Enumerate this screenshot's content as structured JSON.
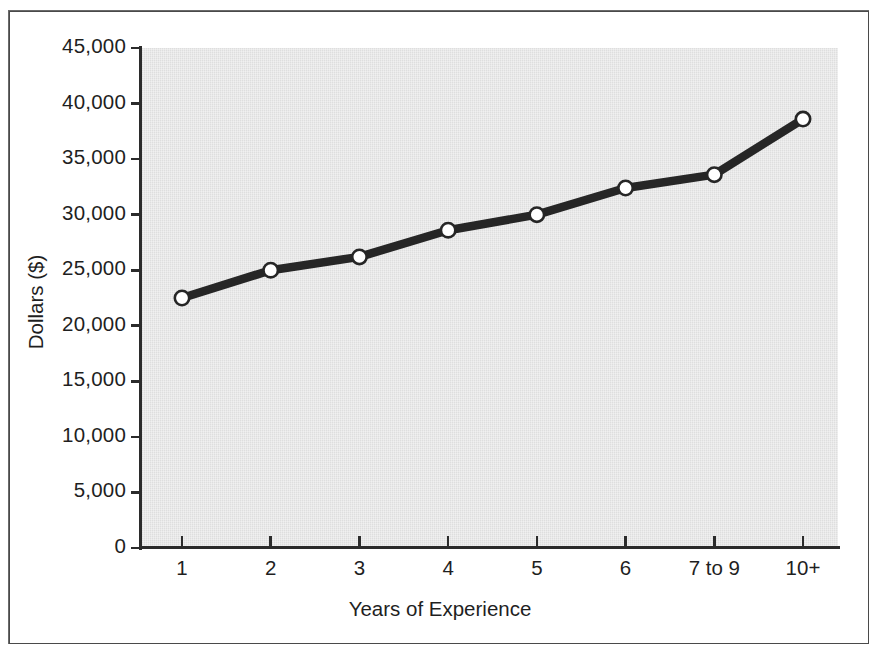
{
  "figure": {
    "background_color": "#ffffff",
    "frame_color": "#6a6a6a",
    "plot_background_color": "#e4e4e4",
    "line_color": "#262626",
    "marker_fill_color": "#ffffff"
  },
  "chart_data": {
    "type": "line",
    "title": "",
    "xlabel": "Years of Experience",
    "ylabel": "Dollars ($)",
    "categories": [
      "1",
      "2",
      "3",
      "4",
      "5",
      "6",
      "7 to 9",
      "10+"
    ],
    "values": [
      22500,
      25000,
      26200,
      28600,
      30000,
      32400,
      33600,
      38600
    ],
    "ylim": [
      0,
      45000
    ],
    "yticks": [
      0,
      5000,
      10000,
      15000,
      20000,
      25000,
      30000,
      35000,
      40000,
      45000
    ],
    "ytick_labels": [
      "0",
      "5,000",
      "10,000",
      "15,000",
      "20,000",
      "25,000",
      "30,000",
      "35,000",
      "40,000",
      "45,000"
    ],
    "grid": false,
    "legend": false,
    "marker": "circle-open",
    "series": [
      {
        "name": "Salary",
        "values": [
          22500,
          25000,
          26200,
          28600,
          30000,
          32400,
          33600,
          38600
        ]
      }
    ]
  }
}
